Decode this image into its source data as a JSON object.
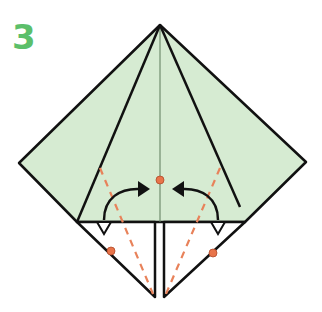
{
  "diagram": {
    "step_number": "3",
    "colors": {
      "paper_fill": "#d6ebd2",
      "line": "#111111",
      "fold_guide": "#e8825a",
      "dot": "#e8744a",
      "step_number": "#5cbf6a"
    },
    "elements": {
      "center_crease": "vertical center crease",
      "valley_folds": [
        "left dashed valley fold",
        "right dashed valley fold"
      ],
      "arrows": [
        "left fold arrow toward center",
        "right fold arrow toward center"
      ],
      "reference_dots": [
        "center dot",
        "left edge dot",
        "right edge dot"
      ],
      "pivot_markers": [
        "left triangle marker",
        "right triangle marker"
      ]
    }
  }
}
